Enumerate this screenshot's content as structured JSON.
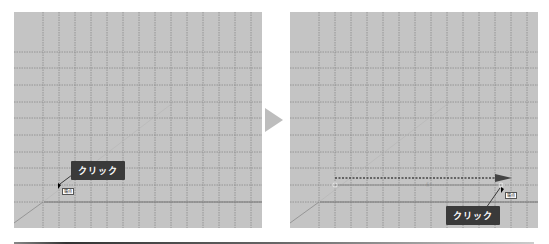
{
  "panels": [
    {
      "id": "before",
      "callout": {
        "label": "クリック"
      },
      "cursor_tag": {
        "label": "端点"
      }
    },
    {
      "id": "after",
      "callout": {
        "label": "クリック"
      },
      "cursor_tag": {
        "label": "端点"
      },
      "dimension_label": "長さ"
    }
  ],
  "colors": {
    "canvas": "#c4c4c4",
    "grid": "#8a8a8a",
    "callout_bg": "#3a3a3a",
    "arrow": "#bdbdbd"
  }
}
